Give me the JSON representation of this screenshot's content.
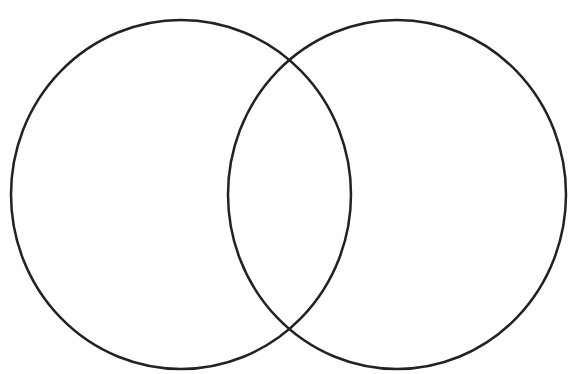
{
  "diagram": {
    "type": "venn",
    "set_count": 2,
    "background": "#ffffff",
    "stroke_color": "#222222",
    "stroke_width": 2.5,
    "sets": [
      {
        "id": "left-set",
        "cx": 181,
        "cy": 194.5,
        "rx": 170,
        "ry": 174.5,
        "label": ""
      },
      {
        "id": "right-set",
        "cx": 397,
        "cy": 194.5,
        "rx": 169,
        "ry": 174.5,
        "label": ""
      }
    ]
  }
}
